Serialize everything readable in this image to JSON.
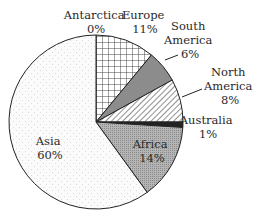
{
  "chart_data": {
    "type": "pie",
    "title": "",
    "start_angle": "12 o'clock",
    "direction": "clockwise",
    "categories": [
      "Europe",
      "South America",
      "North America",
      "Australia",
      "Africa",
      "Asia",
      "Antarctica"
    ],
    "values": [
      11,
      6,
      8,
      1,
      14,
      60,
      0
    ],
    "unit": "%",
    "slices": [
      {
        "name": "Europe",
        "value": 11,
        "label_lines": [
          "Europe",
          "11%"
        ],
        "fill": "crosshatch"
      },
      {
        "name": "South America",
        "value": 6,
        "label_lines": [
          "South",
          "America",
          "6%"
        ],
        "fill": "#8c8c8c"
      },
      {
        "name": "North America",
        "value": 8,
        "label_lines": [
          "North",
          "America",
          "8%"
        ],
        "fill": "diagonal-stripes"
      },
      {
        "name": "Australia",
        "value": 1,
        "label_lines": [
          "Australia",
          "1%"
        ],
        "fill": "#222222"
      },
      {
        "name": "Africa",
        "value": 14,
        "label_lines": [
          "Africa",
          "14%"
        ],
        "fill": "dense-gray-dots"
      },
      {
        "name": "Asia",
        "value": 60,
        "label_lines": [
          "Asia",
          "60%"
        ],
        "fill": "light-dots"
      },
      {
        "name": "Antarctica",
        "value": 0,
        "label_lines": [
          "Antarctica",
          "0%"
        ],
        "fill": "none"
      }
    ],
    "legend": "none",
    "grid": false
  }
}
